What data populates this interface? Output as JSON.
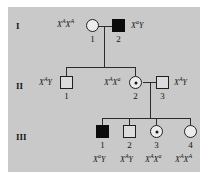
{
  "figure": {
    "background_color": "#ffffff",
    "panel_color": "#c9c9c9"
  },
  "generations": [
    {
      "label": "I"
    },
    {
      "label": "II"
    },
    {
      "label": "III"
    }
  ],
  "individuals": {
    "i1": {
      "id": "I-1",
      "number": "1",
      "sex": "female",
      "shape": "circle",
      "status": "unaffected",
      "genotype_x": "X",
      "genotype_sup1": "A",
      "genotype_mid": "X",
      "genotype_sup2": "A"
    },
    "i2": {
      "id": "I-2",
      "number": "2",
      "sex": "male",
      "shape": "square",
      "status": "affected",
      "genotype_x": "X",
      "genotype_sup1": "a",
      "genotype_mid": "Y",
      "genotype_sup2": ""
    },
    "ii1": {
      "id": "II-1",
      "number": "1",
      "sex": "male",
      "shape": "square",
      "status": "unaffected",
      "genotype_x": "X",
      "genotype_sup1": "A",
      "genotype_mid": "Y",
      "genotype_sup2": ""
    },
    "ii2": {
      "id": "II-2",
      "number": "2",
      "sex": "female",
      "shape": "circle",
      "status": "carrier",
      "genotype_x": "X",
      "genotype_sup1": "A",
      "genotype_mid": "X",
      "genotype_sup2": "a"
    },
    "ii3": {
      "id": "II-3",
      "number": "3",
      "sex": "male",
      "shape": "square",
      "status": "unaffected",
      "genotype_x": "X",
      "genotype_sup1": "A",
      "genotype_mid": "Y",
      "genotype_sup2": ""
    },
    "iii1": {
      "id": "III-1",
      "number": "1",
      "sex": "male",
      "shape": "square",
      "status": "affected",
      "genotype_x": "X",
      "genotype_sup1": "a",
      "genotype_mid": "Y",
      "genotype_sup2": ""
    },
    "iii2": {
      "id": "III-2",
      "number": "2",
      "sex": "male",
      "shape": "square",
      "status": "unaffected",
      "genotype_x": "X",
      "genotype_sup1": "A",
      "genotype_mid": "Y",
      "genotype_sup2": ""
    },
    "iii3": {
      "id": "III-3",
      "number": "3",
      "sex": "female",
      "shape": "circle",
      "status": "carrier",
      "genotype_x": "X",
      "genotype_sup1": "A",
      "genotype_mid": "X",
      "genotype_sup2": "a"
    },
    "iii4": {
      "id": "III-4",
      "number": "4",
      "sex": "female",
      "shape": "circle",
      "status": "unaffected",
      "genotype_x": "X",
      "genotype_sup1": "A",
      "genotype_mid": "X",
      "genotype_sup2": "A"
    }
  },
  "colors": {
    "affected_fill": "#0b0b0b",
    "unaffected_fill": "#dcdcdc",
    "line": "#2b2b2b",
    "text": "#161616"
  }
}
